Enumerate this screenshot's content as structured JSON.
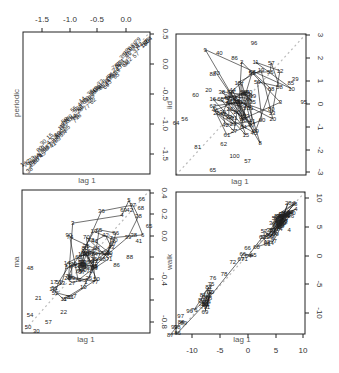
{
  "chart_data": [
    {
      "type": "scatter",
      "panel": "top-left",
      "title": "",
      "xlabel": "lag 1",
      "ylabel": "periodic",
      "xlim": [
        -1.85,
        0.45
      ],
      "ylim": [
        -1.85,
        0.5
      ],
      "x_ticks": [
        "-1.5",
        "-1.0",
        "-0.5",
        "0.0"
      ],
      "x_ticks_side": "top",
      "y_ticks": [
        "0.5",
        "0.0",
        "-0.5",
        "-1.0",
        "-1.5"
      ],
      "y_ticks_side": "right",
      "diagonal": true,
      "description": "Lag-1 plot of a periodic series; numbered points lie tightly along the diagonal from about (-1.8,-1.8) to (0.4,0.4)",
      "sample_labels": [
        "99",
        "93",
        "97",
        "98"
      ]
    },
    {
      "type": "scatter",
      "panel": "top-right",
      "title": "",
      "xlabel": "lag 1",
      "ylabel": "iid",
      "xlim": [
        -3,
        3
      ],
      "ylim": [
        -3,
        3
      ],
      "y_ticks": [
        "3",
        "2",
        "1",
        "0",
        "-1",
        "-2",
        "-3"
      ],
      "y_ticks_side": "right",
      "diagonal": true,
      "description": "Lag-1 plot of iid noise; a diffuse cloud centered near (0,0) with points connected in order",
      "labeled_points": [
        {
          "label": "96",
          "x": 0.6,
          "y": 2.6
        },
        {
          "label": "40",
          "x": -1.0,
          "y": 2.2
        },
        {
          "label": "86",
          "x": -0.3,
          "y": 2.0
        },
        {
          "label": "39",
          "x": 2.5,
          "y": 1.1
        },
        {
          "label": "85",
          "x": 2.3,
          "y": 0.9
        },
        {
          "label": "95",
          "x": 2.9,
          "y": 0.1
        },
        {
          "label": "88",
          "x": -1.3,
          "y": 1.3
        },
        {
          "label": "20",
          "x": -1.5,
          "y": 0.6
        },
        {
          "label": "60",
          "x": -2.1,
          "y": 0.4
        },
        {
          "label": "80",
          "x": 1.4,
          "y": -0.2
        },
        {
          "label": "56",
          "x": -2.6,
          "y": -0.6
        },
        {
          "label": "64",
          "x": -3.0,
          "y": -0.8
        },
        {
          "label": "81",
          "x": -2.0,
          "y": -1.8
        },
        {
          "label": "62",
          "x": -0.8,
          "y": -1.7
        },
        {
          "label": "100",
          "x": -0.3,
          "y": -2.2
        },
        {
          "label": "57",
          "x": 0.3,
          "y": -2.4
        },
        {
          "label": "65",
          "x": -1.3,
          "y": -2.8
        }
      ]
    },
    {
      "type": "scatter",
      "panel": "bottom-left",
      "title": "",
      "xlabel": "lag 1",
      "ylabel": "ma",
      "xlim": [
        -0.88,
        0.38
      ],
      "ylim": [
        -0.88,
        0.4
      ],
      "y_ticks": [
        "0.4",
        "0.2",
        "0.0",
        "-0.2",
        "-0.4",
        "-0.6",
        "-0.8"
      ],
      "y_ticks_side": "right",
      "diagonal": true,
      "description": "Lag-1 plot of a moving-average series; points connected and elongated along the diagonal",
      "labeled_points": [
        {
          "label": "66",
          "x": 0.3,
          "y": 0.32
        },
        {
          "label": "68",
          "x": 0.29,
          "y": 0.24
        },
        {
          "label": "69",
          "x": 0.12,
          "y": 0.22
        },
        {
          "label": "42",
          "x": 0.18,
          "y": 0.22
        },
        {
          "label": "65",
          "x": 0.37,
          "y": 0.08
        },
        {
          "label": "38",
          "x": 0.22,
          "y": 0.0
        },
        {
          "label": "41",
          "x": 0.27,
          "y": -0.06
        },
        {
          "label": "90",
          "x": -0.42,
          "y": 0.0
        },
        {
          "label": "78",
          "x": -0.2,
          "y": -0.05
        },
        {
          "label": "88",
          "x": 0.18,
          "y": -0.2
        },
        {
          "label": "86",
          "x": 0.05,
          "y": -0.27
        },
        {
          "label": "48",
          "x": -0.8,
          "y": -0.3
        },
        {
          "label": "17",
          "x": -0.57,
          "y": -0.42
        },
        {
          "label": "51",
          "x": -0.56,
          "y": -0.48
        },
        {
          "label": "7",
          "x": -0.36,
          "y": -0.55
        },
        {
          "label": "6",
          "x": -0.46,
          "y": -0.58
        },
        {
          "label": "90",
          "x": -0.42,
          "y": -0.56
        },
        {
          "label": "21",
          "x": -0.72,
          "y": -0.57
        },
        {
          "label": "22",
          "x": -0.47,
          "y": -0.69
        },
        {
          "label": "54",
          "x": -0.8,
          "y": -0.72
        },
        {
          "label": "57",
          "x": -0.62,
          "y": -0.78
        },
        {
          "label": "50",
          "x": -0.82,
          "y": -0.83
        },
        {
          "label": "30",
          "x": -0.74,
          "y": -0.86
        }
      ]
    },
    {
      "type": "scatter",
      "panel": "bottom-right",
      "title": "",
      "xlabel": "lag 1",
      "ylabel": "walk",
      "xlim": [
        -12,
        10
      ],
      "ylim": [
        -12.5,
        10.5
      ],
      "x_ticks": [
        "-10",
        "-5",
        "0",
        "5",
        "10"
      ],
      "y_ticks": [
        "10",
        "5",
        "0",
        "-5",
        "-10"
      ],
      "y_ticks_side": "right",
      "diagonal": true,
      "description": "Lag-1 plot of a random walk; points lie closely along the diagonal in clusters",
      "labeled_points": [
        {
          "label": "4",
          "x": 7.3,
          "y": 4.3
        },
        {
          "label": "66",
          "x": 0.2,
          "y": 1.5
        },
        {
          "label": "84",
          "x": 4.1,
          "y": 2.2
        },
        {
          "label": "72",
          "x": -2.3,
          "y": -0.8
        },
        {
          "label": "71",
          "x": -0.3,
          "y": -0.4
        },
        {
          "label": "76",
          "x": -5.7,
          "y": -3.4
        },
        {
          "label": "78",
          "x": -3.8,
          "y": -2.8
        },
        {
          "label": "96",
          "x": -9.7,
          "y": -8.8
        },
        {
          "label": "97",
          "x": -11.2,
          "y": -9.6
        },
        {
          "label": "98",
          "x": -11.8,
          "y": -11.3
        },
        {
          "label": "99",
          "x": -12.3,
          "y": -11.3
        }
      ]
    }
  ]
}
